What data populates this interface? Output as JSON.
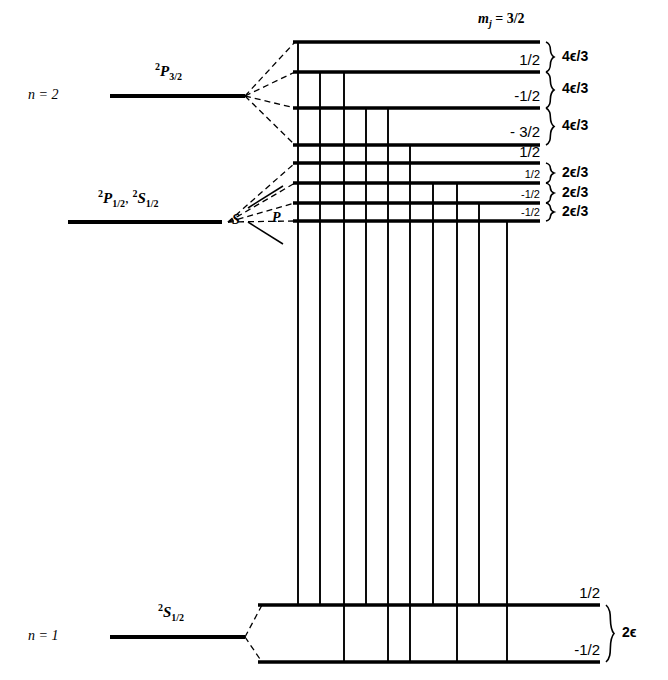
{
  "figure": {
    "title_text": "Zeeman splitting of hydrogen n=1 and n=2 levels",
    "ink_color": "#000000"
  },
  "left_labels": {
    "n2": {
      "text": "n = 2"
    },
    "n1": {
      "text": "n = 1"
    },
    "term_p32": {
      "pre": "2",
      "letter": "P",
      "sub": "3/2"
    },
    "term_p12": {
      "pre": "2",
      "letter": "P",
      "sub": "1/2"
    },
    "comma": ",",
    "term_s12_upper": {
      "pre": "2",
      "letter": "S",
      "sub": "1/2"
    },
    "term_s12_lower": {
      "pre": "2",
      "letter": "S",
      "sub": "1/2"
    }
  },
  "fork_labels": {
    "s": "S",
    "p": "P"
  },
  "header": {
    "mj_prefix": "m",
    "mj_subscript": "j",
    "mj_equals": " = 3/2"
  },
  "upper_levels": [
    {
      "id": "u1",
      "mj": "3/2",
      "y": 42,
      "x_start": 293,
      "x_end": 540,
      "label_x": 540,
      "label_y": 22,
      "label_size": "normal",
      "label_in_header": true
    },
    {
      "id": "u2",
      "mj": "1/2",
      "y": 72,
      "x_start": 293,
      "x_end": 540,
      "label_x": 540,
      "label_y": 52,
      "label_size": "normal",
      "label_in_header": false
    },
    {
      "id": "u3",
      "mj": "-1/2",
      "y": 108,
      "x_start": 293,
      "x_end": 540,
      "label_x": 540,
      "label_y": 88,
      "label_size": "normal",
      "label_in_header": false
    },
    {
      "id": "u4",
      "mj": "- 3/2",
      "y": 145,
      "x_start": 293,
      "x_end": 540,
      "label_x": 540,
      "label_y": 124,
      "label_size": "normal",
      "label_in_header": false
    },
    {
      "id": "u5",
      "mj": "1/2",
      "y": 163,
      "x_start": 293,
      "x_end": 540,
      "label_x": 540,
      "label_y": 144,
      "label_size": "normal",
      "label_in_header": false
    },
    {
      "id": "u6",
      "mj": "1/2",
      "y": 183,
      "x_start": 293,
      "x_end": 540,
      "label_x": 540,
      "label_y": 169,
      "label_size": "small",
      "label_in_header": false
    },
    {
      "id": "u7",
      "mj": "-1/2",
      "y": 203,
      "x_start": 293,
      "x_end": 540,
      "label_x": 540,
      "label_y": 189,
      "label_size": "small",
      "label_in_header": false
    },
    {
      "id": "u8",
      "mj": "-1/2",
      "y": 221,
      "x_start": 293,
      "x_end": 540,
      "label_x": 540,
      "label_y": 207,
      "label_size": "small",
      "label_in_header": false
    }
  ],
  "lower_levels": [
    {
      "id": "g1",
      "mj": "1/2",
      "y": 605,
      "x_start": 258,
      "x_end": 600,
      "label_x": 600,
      "label_y": 585
    },
    {
      "id": "g2",
      "mj": "-1/2",
      "y": 662,
      "x_start": 258,
      "x_end": 600,
      "label_x": 600,
      "label_y": 642
    }
  ],
  "brace_annotations": [
    {
      "id": "b1",
      "text": "4ϵ/3",
      "brace_top": 42,
      "brace_bottom": 72,
      "text_y": 49
    },
    {
      "id": "b2",
      "text": "4ϵ/3",
      "brace_top": 72,
      "brace_bottom": 108,
      "text_y": 81
    },
    {
      "id": "b3",
      "text": "4ϵ/3",
      "brace_top": 108,
      "brace_bottom": 145,
      "text_y": 118
    },
    {
      "id": "b4",
      "text": "2ϵ/3",
      "brace_top": 163,
      "brace_bottom": 183,
      "text_y": 165
    },
    {
      "id": "b5",
      "text": "2ϵ/3",
      "brace_top": 183,
      "brace_bottom": 203,
      "text_y": 185
    },
    {
      "id": "b6",
      "text": "2ϵ/3",
      "brace_top": 203,
      "brace_bottom": 221,
      "text_y": 204
    },
    {
      "id": "b7",
      "text": "2ϵ",
      "brace_top": 605,
      "brace_bottom": 662,
      "text_y": 625
    }
  ],
  "base_levels": [
    {
      "id": "base-n2",
      "y": 96,
      "x_start": 110,
      "x_end": 245
    },
    {
      "id": "base-n1",
      "y": 637,
      "x_start": 110,
      "x_end": 245
    }
  ],
  "base_level_middle": {
    "id": "base-n2-lower",
    "y": 222,
    "x_start": 68,
    "x_end": 222
  },
  "transitions": [
    {
      "id": "t1",
      "x": 298,
      "y_top": 42,
      "y_bottom": 605
    },
    {
      "id": "t2",
      "x": 320,
      "y_top": 72,
      "y_bottom": 605
    },
    {
      "id": "t3",
      "x": 344,
      "y_top": 72,
      "y_bottom": 662
    },
    {
      "id": "t4",
      "x": 366,
      "y_top": 108,
      "y_bottom": 605
    },
    {
      "id": "t5",
      "x": 388,
      "y_top": 108,
      "y_bottom": 662
    },
    {
      "id": "t6",
      "x": 410,
      "y_top": 145,
      "y_bottom": 662
    },
    {
      "id": "t7",
      "x": 433,
      "y_top": 183,
      "y_bottom": 605
    },
    {
      "id": "t8",
      "x": 457,
      "y_top": 183,
      "y_bottom": 662
    },
    {
      "id": "t9",
      "x": 479,
      "y_top": 203,
      "y_bottom": 605
    },
    {
      "id": "t10",
      "x": 507,
      "y_top": 221,
      "y_bottom": 662
    }
  ],
  "dashed_fans": {
    "upper_origin": {
      "x": 245,
      "y": 96
    },
    "upper_targets": [
      42,
      72,
      108,
      145
    ],
    "middle_origin": {
      "x": 228,
      "y": 222
    },
    "middle_targets": [
      163,
      183,
      203,
      221
    ],
    "ground_origin": {
      "x": 245,
      "y": 637
    },
    "ground_targets": [
      605,
      662
    ]
  }
}
